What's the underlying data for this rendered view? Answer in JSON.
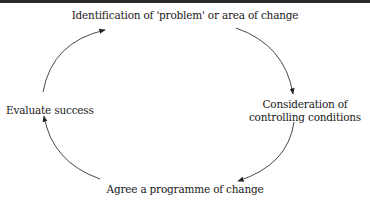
{
  "diagram": {
    "type": "cycle",
    "nodes": [
      {
        "id": "top",
        "label": "Identification of 'problem' or area of change"
      },
      {
        "id": "right",
        "label": "Consideration of controlling conditions"
      },
      {
        "id": "bottom",
        "label": "Agree a programme of change"
      },
      {
        "id": "left",
        "label": "Evaluate success"
      }
    ],
    "edges": [
      {
        "from": "top",
        "to": "right"
      },
      {
        "from": "right",
        "to": "bottom"
      },
      {
        "from": "bottom",
        "to": "left"
      },
      {
        "from": "left",
        "to": "top"
      }
    ],
    "colors": {
      "line": "#333333",
      "text": "#1a1a1a"
    }
  }
}
